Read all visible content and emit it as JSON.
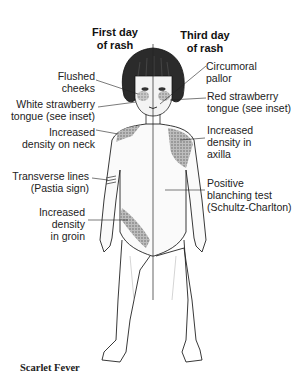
{
  "figure": {
    "caption": "Scarlet Fever",
    "headers": {
      "left": [
        "First day",
        "of rash"
      ],
      "right": [
        "Third day",
        "of rash"
      ]
    },
    "labels_left": [
      {
        "id": "flushed-cheeks",
        "lines": [
          "Flushed",
          "cheeks"
        ]
      },
      {
        "id": "white-strawberry-tongue",
        "lines": [
          "White strawberry",
          "tongue (see inset)"
        ]
      },
      {
        "id": "increased-density-neck",
        "lines": [
          "Increased",
          "density on neck"
        ]
      },
      {
        "id": "transverse-lines",
        "lines": [
          "Transverse lines",
          "(Pastia sign)"
        ]
      },
      {
        "id": "increased-density-groin",
        "lines": [
          "Increased",
          "density",
          "in groin"
        ]
      }
    ],
    "labels_right": [
      {
        "id": "circumoral-pallor",
        "lines": [
          "Circumoral",
          "pallor"
        ]
      },
      {
        "id": "red-strawberry-tongue",
        "lines": [
          "Red strawberry",
          "tongue (see inset)"
        ]
      },
      {
        "id": "increased-density-axilla",
        "lines": [
          "Increased",
          "density in",
          "axilla"
        ]
      },
      {
        "id": "positive-blanching-test",
        "lines": [
          "Positive",
          "blanching test",
          "(Schultz-Charlton)"
        ]
      }
    ],
    "colors": {
      "ink": "#1a1a1a",
      "rash_shading": "#8a8a8a",
      "background": "#ffffff"
    }
  }
}
